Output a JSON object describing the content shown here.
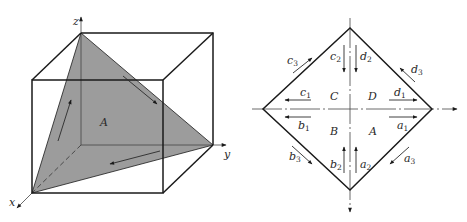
{
  "left_figure": {
    "axes": {
      "x": "x",
      "y": "y",
      "z": "z"
    },
    "region_label": "A",
    "fill_color": "#9a9a9a",
    "cube": {
      "back_top_left": [
        81,
        33
      ],
      "back_top_right": [
        213,
        33
      ],
      "back_bottom_right": [
        213,
        145
      ],
      "origin": [
        81,
        145
      ],
      "front_top_left": [
        32,
        80
      ],
      "front_top_right": [
        163,
        80
      ],
      "front_bottom_left": [
        32,
        193
      ],
      "front_bottom_right": [
        163,
        193
      ]
    },
    "triangle": [
      [
        81,
        33
      ],
      [
        213,
        145
      ],
      [
        32,
        193
      ]
    ]
  },
  "right_figure": {
    "quadrants": {
      "top_left": "C",
      "top_right": "D",
      "bottom_left": "B",
      "bottom_right": "A"
    },
    "diamond": {
      "top": [
        350,
        28
      ],
      "right": [
        432,
        109
      ],
      "bottom": [
        350,
        190
      ],
      "left": [
        263,
        109
      ]
    },
    "arrow_labels": {
      "c1": {
        "base": "c",
        "sub": "1"
      },
      "c2": {
        "base": "c",
        "sub": "2"
      },
      "c3": {
        "base": "c",
        "sub": "3"
      },
      "d1": {
        "base": "d",
        "sub": "1"
      },
      "d2": {
        "base": "d",
        "sub": "2"
      },
      "d3": {
        "base": "d",
        "sub": "3"
      },
      "b1": {
        "base": "b",
        "sub": "1"
      },
      "b2": {
        "base": "b",
        "sub": "2"
      },
      "b3": {
        "base": "b",
        "sub": "3"
      },
      "a1": {
        "base": "a",
        "sub": "1"
      },
      "a2": {
        "base": "a",
        "sub": "2"
      },
      "a3": {
        "base": "a",
        "sub": "3"
      }
    }
  }
}
